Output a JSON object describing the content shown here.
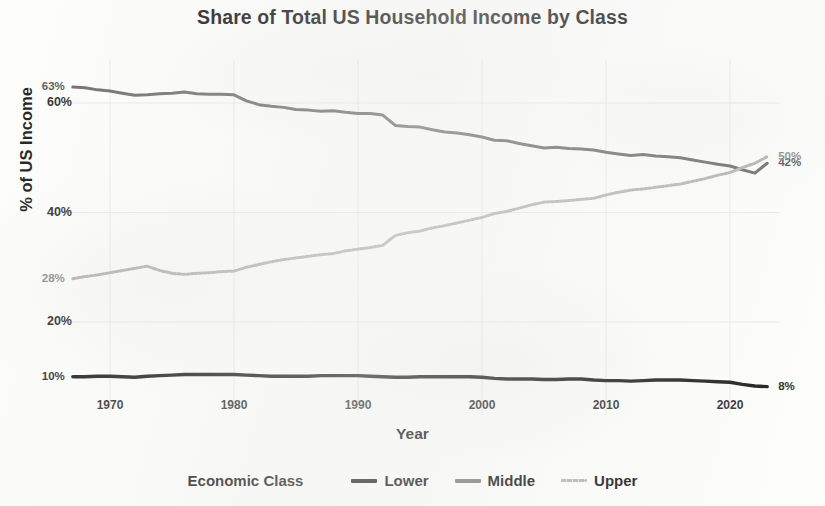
{
  "chart_data": {
    "type": "line",
    "title": "Share of Total US Household Income by Class",
    "xlabel": "Year",
    "ylabel": "% of US Income",
    "xlim": [
      1967,
      2023
    ],
    "ylim": [
      0,
      68
    ],
    "grid": true,
    "legend_position": "bottom",
    "legend_title": "Economic Class",
    "x_ticks": [
      "1970",
      "1980",
      "1990",
      "2000",
      "2010",
      "2020"
    ],
    "x_tick_values": [
      1970,
      1980,
      1990,
      2000,
      2010,
      2020
    ],
    "y_ticks": [
      "20%",
      "40%",
      "60%"
    ],
    "y_tick_values": [
      20,
      40,
      60
    ],
    "x": [
      1967,
      1968,
      1969,
      1970,
      1971,
      1972,
      1973,
      1974,
      1975,
      1976,
      1977,
      1978,
      1979,
      1980,
      1981,
      1982,
      1983,
      1984,
      1985,
      1986,
      1987,
      1988,
      1989,
      1990,
      1991,
      1992,
      1993,
      1994,
      1995,
      1996,
      1997,
      1998,
      1999,
      2000,
      2001,
      2002,
      2003,
      2004,
      2005,
      2006,
      2007,
      2008,
      2009,
      2010,
      2011,
      2012,
      2013,
      2014,
      2015,
      2016,
      2017,
      2018,
      2019,
      2020,
      2021,
      2022,
      2023
    ],
    "series": [
      {
        "name": "Lower",
        "color": "#1a1a1a",
        "style": "solid",
        "start_label": "10%",
        "end_label": "8%",
        "values": [
          10.0,
          10.0,
          10.1,
          10.1,
          10.0,
          9.9,
          10.1,
          10.2,
          10.3,
          10.4,
          10.4,
          10.4,
          10.4,
          10.4,
          10.3,
          10.2,
          10.1,
          10.1,
          10.1,
          10.1,
          10.2,
          10.2,
          10.2,
          10.2,
          10.1,
          10.0,
          9.9,
          9.9,
          10.0,
          10.0,
          10.0,
          10.0,
          10.0,
          9.9,
          9.7,
          9.6,
          9.6,
          9.6,
          9.5,
          9.5,
          9.6,
          9.6,
          9.4,
          9.3,
          9.3,
          9.2,
          9.3,
          9.4,
          9.4,
          9.4,
          9.3,
          9.2,
          9.1,
          9.0,
          8.6,
          8.3,
          8.2
        ]
      },
      {
        "name": "Middle",
        "color": "#6b6b69",
        "style": "solid",
        "start_label": "63%",
        "end_label": "42%",
        "values": [
          62.9,
          62.8,
          62.4,
          62.2,
          61.8,
          61.4,
          61.5,
          61.7,
          61.8,
          62.0,
          61.7,
          61.6,
          61.6,
          61.5,
          60.4,
          59.7,
          59.4,
          59.2,
          58.8,
          58.7,
          58.5,
          58.6,
          58.3,
          58.1,
          58.1,
          57.8,
          55.9,
          55.7,
          55.6,
          55.1,
          54.7,
          54.5,
          54.2,
          53.8,
          53.2,
          53.1,
          52.6,
          52.2,
          51.8,
          51.9,
          51.7,
          51.6,
          51.4,
          51.0,
          50.7,
          50.4,
          50.6,
          50.3,
          50.2,
          50.0,
          49.6,
          49.2,
          48.8,
          48.5,
          47.8,
          47.2,
          49.0
        ]
      },
      {
        "name": "Upper",
        "color": "#b4b4b2",
        "style": "dotted",
        "start_label": "28%",
        "end_label": "50%",
        "values": [
          27.9,
          28.3,
          28.6,
          29.0,
          29.4,
          29.8,
          30.2,
          29.4,
          28.9,
          28.7,
          28.9,
          29.0,
          29.2,
          29.3,
          30.0,
          30.5,
          31.0,
          31.4,
          31.7,
          32.0,
          32.3,
          32.5,
          33.0,
          33.3,
          33.6,
          34.0,
          35.8,
          36.3,
          36.6,
          37.2,
          37.6,
          38.1,
          38.6,
          39.1,
          39.8,
          40.2,
          40.8,
          41.4,
          41.9,
          42.0,
          42.2,
          42.4,
          42.6,
          43.2,
          43.7,
          44.1,
          44.3,
          44.6,
          44.9,
          45.2,
          45.7,
          46.2,
          46.8,
          47.3,
          48.2,
          49.0,
          50.2
        ]
      }
    ]
  },
  "legend": {
    "title": "Economic Class",
    "items": [
      {
        "label": "Lower",
        "color": "#1a1a1a",
        "style": "solid"
      },
      {
        "label": "Middle",
        "color": "#7a7a78",
        "style": "solid"
      },
      {
        "label": "Upper",
        "color": "#b4b4b2",
        "style": "dotted"
      }
    ]
  }
}
